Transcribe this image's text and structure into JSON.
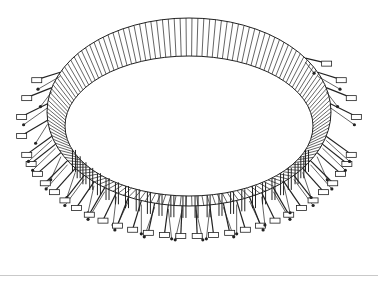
{
  "figure": {
    "subject": "Ring-shaped structure with radial ribs, bracing struts, tension cables and footings (line drawing)",
    "stroke_color": "#222222",
    "background": "#ffffff",
    "rule_color": "#c9c9c9"
  },
  "geometry": {
    "center": [
      189,
      112
    ],
    "outer_ellipse": {
      "rx": 142,
      "ry": 94,
      "cy": 112
    },
    "inner_ellipse": {
      "rx": 124,
      "ry": 70,
      "cy": 126
    },
    "rib_count": 150,
    "support_count": 26,
    "support_start_deg": 200,
    "support_end_deg": 340
  }
}
